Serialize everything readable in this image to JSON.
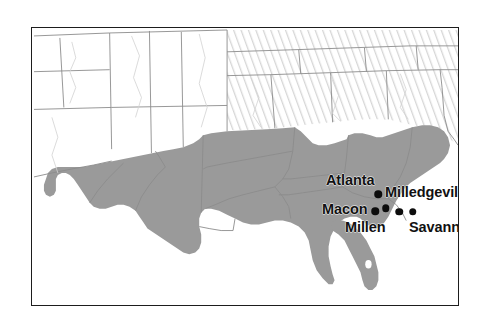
{
  "figure": {
    "type": "reference-map",
    "title": "",
    "background_color": "#ffffff",
    "frame_color": "#1d1d1d"
  },
  "legend_styles": {
    "highlighted_region_label": "southern states (solid gray fill)",
    "highlighted_region_color": "#9a9a9a",
    "hatched_region_label": "northern states (diagonal hatch)",
    "hatched_region_color": "#e8e8e8",
    "plain_region_label": "western states (white fill)",
    "plain_region_color": "#ffffff",
    "boundary_color": "#8c8c8c",
    "marker_color": "#0d0d0d"
  },
  "cities": [
    {
      "name": "Atlanta",
      "label": "Atlanta",
      "marker": "city-dot",
      "x": 346,
      "y": 166
    },
    {
      "name": "Milledgeville",
      "label": "Milledgeville",
      "marker": "city-dot",
      "x": 353.5,
      "y": 180
    },
    {
      "name": "Macon",
      "label": "Macon",
      "marker": "city-dot",
      "x": 343,
      "y": 183
    },
    {
      "name": "Millen",
      "label": "Millen",
      "marker": "city-dot",
      "x": 367,
      "y": 183.5
    },
    {
      "name": "Savannah",
      "label": "Savannah",
      "marker": "city-dot",
      "x": 380.5,
      "y": 183.5
    }
  ]
}
